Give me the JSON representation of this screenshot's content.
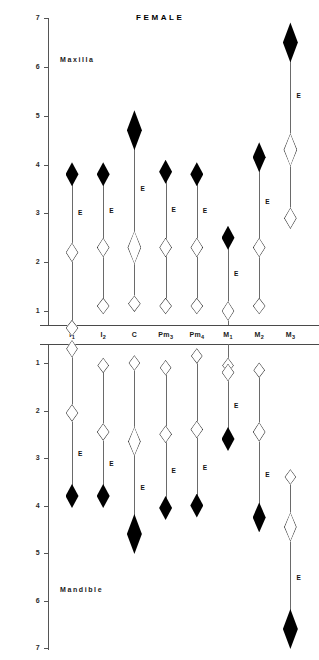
{
  "title": "FEMALE",
  "sections": {
    "maxilla_label": "Maxilla",
    "mandible_label": "Mandible"
  },
  "axis": {
    "maxilla_ticks": [
      "7",
      "6",
      "5",
      "4",
      "3",
      "2",
      "1"
    ],
    "mandible_ticks": [
      "1",
      "2",
      "3",
      "4",
      "5",
      "6",
      "7"
    ]
  },
  "teeth": [
    {
      "base": "I",
      "sub": "1"
    },
    {
      "base": "I",
      "sub": "2"
    },
    {
      "base": "C",
      "sub": ""
    },
    {
      "base": "Pm",
      "sub": "3"
    },
    {
      "base": "Pm",
      "sub": "4"
    },
    {
      "base": "M",
      "sub": "1"
    },
    {
      "base": "M",
      "sub": "2"
    },
    {
      "base": "M",
      "sub": "3"
    }
  ],
  "marker_label": "E",
  "chart_data": {
    "type": "scatter",
    "title": "FEMALE",
    "xlabel": "",
    "ylabel": "Age (years)",
    "ylim": [
      1,
      7
    ],
    "grid": false,
    "legend": null,
    "categories": [
      "I1",
      "I2",
      "C",
      "Pm3",
      "Pm4",
      "M1",
      "M2",
      "M3"
    ],
    "series": [
      {
        "name": "Maxilla - filled diamond (upper marker)",
        "jaw": "maxilla",
        "fill": "solid",
        "values": [
          3.8,
          3.8,
          4.7,
          3.85,
          3.8,
          2.5,
          4.15,
          6.5
        ]
      },
      {
        "name": "Maxilla - open diamond (middle marker, E)",
        "jaw": "maxilla",
        "fill": "open",
        "values": [
          2.2,
          2.3,
          2.3,
          2.3,
          2.3,
          1.0,
          2.3,
          4.3
        ]
      },
      {
        "name": "Maxilla - open diamond (lower marker)",
        "jaw": "maxilla",
        "fill": "open",
        "values": [
          0.65,
          1.1,
          1.15,
          1.1,
          1.1,
          null,
          1.1,
          2.9
        ]
      },
      {
        "name": "Mandible - open diamond (upper marker)",
        "jaw": "mandible",
        "fill": "open",
        "values": [
          0.7,
          1.05,
          1.0,
          1.1,
          0.85,
          1.05,
          1.15,
          3.4
        ]
      },
      {
        "name": "Mandible - open diamond (middle marker, E)",
        "jaw": "mandible",
        "fill": "open",
        "values": [
          2.05,
          2.45,
          2.65,
          2.5,
          2.4,
          1.2,
          2.45,
          4.45
        ]
      },
      {
        "name": "Mandible - filled diamond (lower marker)",
        "jaw": "mandible",
        "fill": "solid",
        "values": [
          3.8,
          3.8,
          4.6,
          4.05,
          4.0,
          2.6,
          4.25,
          6.6
        ]
      }
    ]
  }
}
